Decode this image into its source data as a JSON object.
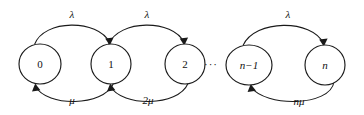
{
  "diagram": {
    "type": "state-transition-diagram",
    "stroke_color": "#1a1a1a",
    "background_color": "#ffffff",
    "nodes": [
      {
        "id": "s0",
        "label": "0",
        "cx": 40,
        "cy": 64,
        "rx": 21,
        "ry": 20,
        "italic": false
      },
      {
        "id": "s1",
        "label": "1",
        "cx": 111,
        "cy": 64,
        "rx": 20,
        "ry": 20,
        "italic": false
      },
      {
        "id": "s2",
        "label": "2",
        "cx": 185,
        "cy": 64,
        "rx": 20,
        "ry": 20,
        "italic": false
      },
      {
        "id": "sn1",
        "label": "n−1",
        "cx": 249,
        "cy": 65,
        "rx": 23,
        "ry": 20,
        "italic": true
      },
      {
        "id": "sn",
        "label": "n",
        "cx": 325,
        "cy": 65,
        "rx": 20,
        "ry": 20,
        "italic": true
      }
    ],
    "ellipsis": {
      "text": "···",
      "x": 211,
      "y": 65
    },
    "forward_edges": [
      {
        "from": "s0",
        "to": "s1",
        "label": "λ",
        "label_x": 72,
        "label_y": 15
      },
      {
        "from": "s1",
        "to": "s2",
        "label": "λ",
        "label_x": 147,
        "label_y": 15
      },
      {
        "from": "sn1",
        "to": "sn",
        "label": "λ",
        "label_x": 288,
        "label_y": 15
      }
    ],
    "backward_edges": [
      {
        "from": "s1",
        "to": "s0",
        "label": "μ",
        "label_x": 72,
        "label_y": 101
      },
      {
        "from": "s2",
        "to": "s1",
        "label": "2μ",
        "label_x": 148,
        "label_y": 101
      },
      {
        "from": "sn",
        "to": "sn1",
        "label": "nμ",
        "label_x": 299,
        "label_y": 102
      }
    ]
  }
}
